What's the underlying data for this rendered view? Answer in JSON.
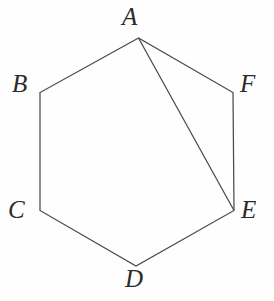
{
  "figure": {
    "name": "hexagon-with-diagonal",
    "width": 274,
    "height": 301,
    "background_color": "#fefefe",
    "stroke_color": "#4a4a4a",
    "stroke_width": 1.25,
    "label_color": "#2b2b2b"
  },
  "vertices": [
    {
      "id": "A",
      "label": "A",
      "x": 138.5,
      "y": 38.0,
      "label_x": 122,
      "label_y": 4
    },
    {
      "id": "B",
      "label": "B",
      "x": 40.0,
      "y": 92.5,
      "label_x": 12,
      "label_y": 71
    },
    {
      "id": "C",
      "label": "C",
      "x": 40.0,
      "y": 210.5,
      "label_x": 8,
      "label_y": 197
    },
    {
      "id": "D",
      "label": "D",
      "x": 136.0,
      "y": 266.0,
      "label_x": 125,
      "label_y": 266
    },
    {
      "id": "E",
      "label": "E",
      "x": 234.0,
      "y": 210.5,
      "label_x": 241,
      "label_y": 197
    },
    {
      "id": "F",
      "label": "F",
      "x": 233.0,
      "y": 92.5,
      "label_x": 240,
      "label_y": 71
    }
  ],
  "edges": [
    {
      "from": "A",
      "to": "B"
    },
    {
      "from": "B",
      "to": "C"
    },
    {
      "from": "C",
      "to": "D"
    },
    {
      "from": "D",
      "to": "E"
    },
    {
      "from": "E",
      "to": "F"
    },
    {
      "from": "F",
      "to": "A"
    }
  ],
  "diagonals": [
    {
      "from": "A",
      "to": "E"
    }
  ],
  "polygon_path": "M 138.5 38 L 40 92.5 L 40 210.5 L 136 266 L 234 210.5 L 233 92.5 Z",
  "diagonal_path": "M 138.5 38 L 234 210.5"
}
